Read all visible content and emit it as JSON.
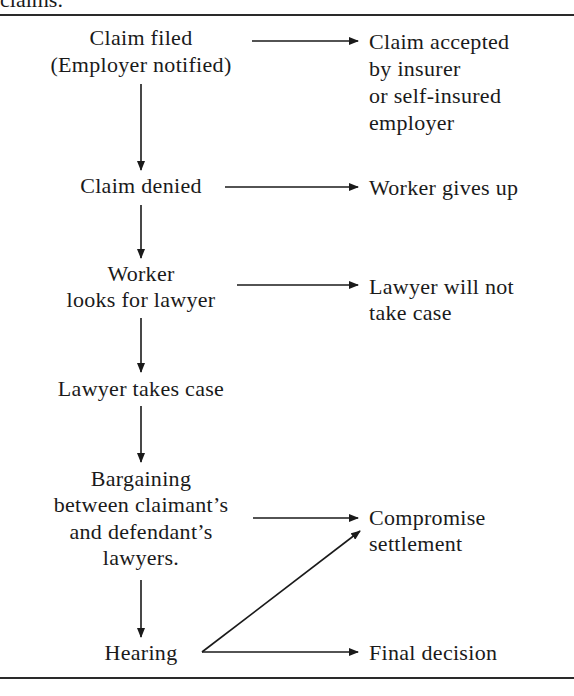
{
  "caption_fragment": "claims.",
  "flow": {
    "main_steps": [
      {
        "id": "claim-filed",
        "lines": [
          "Claim filed",
          "(Employer notified)"
        ]
      },
      {
        "id": "claim-denied",
        "lines": [
          "Claim denied"
        ]
      },
      {
        "id": "worker-looks-for-lawyer",
        "lines": [
          "Worker",
          "looks for lawyer"
        ]
      },
      {
        "id": "lawyer-takes-case",
        "lines": [
          "Lawyer takes case"
        ]
      },
      {
        "id": "bargaining",
        "lines": [
          "Bargaining",
          "between claimant’s",
          "and defendant’s",
          "lawyers."
        ]
      },
      {
        "id": "hearing",
        "lines": [
          "Hearing"
        ]
      }
    ],
    "outcomes": [
      {
        "id": "claim-accepted",
        "from": "claim-filed",
        "lines": [
          "Claim accepted",
          "by insurer",
          "or self-insured",
          "employer"
        ]
      },
      {
        "id": "worker-gives-up",
        "from": "claim-denied",
        "lines": [
          "Worker gives up"
        ]
      },
      {
        "id": "lawyer-will-not-take-case",
        "from": "worker-looks-for-lawyer",
        "lines": [
          "Lawyer will not",
          "take case"
        ]
      },
      {
        "id": "compromise-settlement",
        "from": [
          "bargaining",
          "hearing"
        ],
        "lines": [
          "Compromise",
          "settlement"
        ]
      },
      {
        "id": "final-decision",
        "from": "hearing",
        "lines": [
          "Final decision"
        ]
      }
    ],
    "edges": [
      {
        "from": "claim-filed",
        "to": "claim-accepted"
      },
      {
        "from": "claim-filed",
        "to": "claim-denied"
      },
      {
        "from": "claim-denied",
        "to": "worker-gives-up"
      },
      {
        "from": "claim-denied",
        "to": "worker-looks-for-lawyer"
      },
      {
        "from": "worker-looks-for-lawyer",
        "to": "lawyer-will-not-take-case"
      },
      {
        "from": "worker-looks-for-lawyer",
        "to": "lawyer-takes-case"
      },
      {
        "from": "lawyer-takes-case",
        "to": "bargaining"
      },
      {
        "from": "bargaining",
        "to": "compromise-settlement"
      },
      {
        "from": "bargaining",
        "to": "hearing"
      },
      {
        "from": "hearing",
        "to": "compromise-settlement"
      },
      {
        "from": "hearing",
        "to": "final-decision"
      }
    ]
  },
  "colors": {
    "ink": "#1a1a1a",
    "background": "#ffffff"
  }
}
